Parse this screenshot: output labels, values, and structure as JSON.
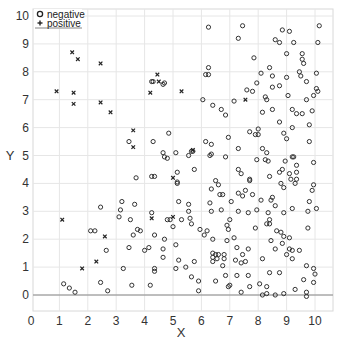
{
  "chart_data": {
    "type": "scatter",
    "title": "",
    "xlabel": "X",
    "ylabel": "Y",
    "xlim": [
      0,
      10.5
    ],
    "ylim": [
      -0.5,
      10.3
    ],
    "xticks": [
      0,
      1,
      2,
      3,
      4,
      5,
      6,
      7,
      8,
      9,
      10
    ],
    "yticks": [
      0,
      1,
      2,
      3,
      4,
      5,
      6,
      7,
      8,
      9,
      10
    ],
    "grid": true,
    "hline_y": 0,
    "legend": {
      "position": "upper left",
      "entries": [
        {
          "label": "negative",
          "marker": "circle"
        },
        {
          "label": "positive",
          "marker": "x"
        }
      ]
    },
    "series": [
      {
        "name": "negative",
        "marker": "circle",
        "points": [
          [
            6.25,
            9.6
          ],
          [
            7.45,
            9.65
          ],
          [
            7.3,
            9.2
          ],
          [
            8.85,
            9.5
          ],
          [
            9.1,
            9.45
          ],
          [
            10.15,
            9.65
          ],
          [
            8.6,
            9.15
          ],
          [
            8.75,
            9.05
          ],
          [
            9.25,
            9.05
          ],
          [
            10.1,
            9.05
          ],
          [
            9.0,
            8.65
          ],
          [
            9.55,
            8.65
          ],
          [
            7.85,
            8.5
          ],
          [
            9.55,
            8.45
          ],
          [
            9.6,
            8.3
          ],
          [
            6.25,
            8.15
          ],
          [
            6.15,
            7.9
          ],
          [
            6.25,
            7.9
          ],
          [
            8.4,
            8.15
          ],
          [
            8.1,
            7.95
          ],
          [
            8.5,
            7.85
          ],
          [
            9.0,
            7.8
          ],
          [
            9.45,
            8.0
          ],
          [
            9.5,
            7.85
          ],
          [
            10.05,
            7.95
          ],
          [
            9.7,
            7.65
          ],
          [
            7.95,
            7.6
          ],
          [
            7.6,
            7.35
          ],
          [
            7.8,
            7.3
          ],
          [
            8.5,
            7.45
          ],
          [
            8.75,
            7.5
          ],
          [
            10.05,
            7.4
          ],
          [
            10.1,
            7.3
          ],
          [
            9.95,
            7.15
          ],
          [
            8.25,
            7.1
          ],
          [
            8.3,
            7.0
          ],
          [
            9.05,
            7.15
          ],
          [
            6.05,
            7.0
          ],
          [
            7.15,
            6.95
          ],
          [
            9.7,
            7.0
          ],
          [
            6.4,
            6.8
          ],
          [
            6.7,
            6.65
          ],
          [
            6.85,
            6.45
          ],
          [
            8.5,
            6.65
          ],
          [
            8.15,
            6.55
          ],
          [
            9.2,
            6.65
          ],
          [
            9.35,
            6.5
          ],
          [
            9.55,
            6.5
          ],
          [
            9.9,
            6.6
          ],
          [
            8.75,
            6.2
          ],
          [
            9.2,
            6.0
          ],
          [
            9.8,
            6.1
          ],
          [
            6.95,
            5.65
          ],
          [
            7.7,
            5.85
          ],
          [
            8.0,
            5.95
          ],
          [
            7.9,
            5.75
          ],
          [
            8.0,
            5.75
          ],
          [
            8.9,
            5.8
          ],
          [
            9.0,
            5.6
          ],
          [
            9.8,
            5.5
          ],
          [
            6.15,
            5.5
          ],
          [
            6.35,
            5.4
          ],
          [
            7.3,
            5.25
          ],
          [
            8.15,
            5.25
          ],
          [
            8.3,
            5.1
          ],
          [
            6.35,
            5.05
          ],
          [
            6.85,
            4.95
          ],
          [
            9.2,
            4.95
          ],
          [
            4.25,
            7.65
          ],
          [
            4.7,
            7.6
          ],
          [
            4.3,
            7.65
          ],
          [
            4.65,
            7.55
          ],
          [
            4.85,
            5.8
          ],
          [
            3.45,
            5.5
          ],
          [
            4.3,
            5.5
          ],
          [
            4.65,
            5.1
          ],
          [
            4.7,
            4.95
          ],
          [
            4.8,
            4.9
          ],
          [
            5.1,
            5.1
          ],
          [
            5.55,
            5.0
          ],
          [
            5.65,
            5.15
          ],
          [
            5.7,
            5.15
          ],
          [
            5.15,
            4.4
          ],
          [
            5.75,
            4.5
          ],
          [
            3.7,
            4.2
          ],
          [
            4.25,
            4.25
          ],
          [
            4.35,
            4.25
          ],
          [
            5.15,
            4.0
          ],
          [
            6.3,
            5.0
          ],
          [
            7.95,
            4.85
          ],
          [
            8.25,
            4.85
          ],
          [
            8.35,
            4.8
          ],
          [
            9.25,
            4.95
          ],
          [
            8.95,
            4.8
          ],
          [
            9.35,
            4.65
          ],
          [
            9.95,
            4.75
          ],
          [
            7.3,
            4.5
          ],
          [
            7.4,
            4.35
          ],
          [
            8.75,
            4.4
          ],
          [
            8.85,
            4.5
          ],
          [
            9.1,
            4.35
          ],
          [
            9.35,
            4.4
          ],
          [
            9.15,
            4.15
          ],
          [
            9.35,
            4.15
          ],
          [
            9.3,
            4.0
          ],
          [
            8.4,
            4.25
          ],
          [
            7.7,
            4.15
          ],
          [
            7.7,
            4.1
          ],
          [
            6.5,
            4.1
          ],
          [
            6.6,
            3.95
          ],
          [
            6.35,
            3.8
          ],
          [
            5.15,
            4.05
          ],
          [
            8.8,
            4.0
          ],
          [
            8.9,
            3.85
          ],
          [
            9.95,
            3.95
          ],
          [
            9.9,
            3.75
          ],
          [
            6.65,
            3.6
          ],
          [
            6.75,
            3.6
          ],
          [
            7.3,
            3.65
          ],
          [
            7.45,
            3.55
          ],
          [
            7.55,
            3.75
          ],
          [
            7.8,
            3.6
          ],
          [
            8.5,
            3.5
          ],
          [
            8.45,
            3.4
          ],
          [
            5.2,
            3.35
          ],
          [
            5.55,
            3.25
          ],
          [
            6.3,
            3.3
          ],
          [
            7.05,
            3.35
          ],
          [
            8.1,
            3.4
          ],
          [
            8.6,
            3.2
          ],
          [
            9.8,
            3.35
          ],
          [
            5.55,
            3.0
          ],
          [
            6.35,
            3.0
          ],
          [
            6.7,
            3.05
          ],
          [
            7.3,
            3.0
          ],
          [
            7.65,
            2.95
          ],
          [
            7.95,
            3.05
          ],
          [
            8.35,
            2.95
          ],
          [
            8.9,
            2.95
          ],
          [
            9.2,
            3.1
          ],
          [
            9.75,
            3.0
          ],
          [
            10.05,
            3.1
          ],
          [
            5.3,
            2.7
          ],
          [
            5.6,
            2.75
          ],
          [
            5.65,
            2.55
          ],
          [
            7.0,
            2.7
          ],
          [
            6.9,
            2.5
          ],
          [
            6.95,
            2.35
          ],
          [
            8.4,
            2.7
          ],
          [
            8.4,
            2.55
          ],
          [
            8.3,
            2.55
          ],
          [
            7.9,
            2.4
          ],
          [
            5.95,
            2.35
          ],
          [
            6.2,
            2.3
          ],
          [
            6.1,
            2.15
          ],
          [
            9.75,
            2.4
          ],
          [
            8.65,
            2.3
          ],
          [
            8.8,
            2.25
          ],
          [
            8.9,
            2.1
          ],
          [
            9.1,
            2.05
          ],
          [
            7.15,
            2.05
          ],
          [
            6.4,
            2.0
          ],
          [
            6.9,
            1.95
          ],
          [
            8.45,
            1.95
          ],
          [
            8.85,
            1.85
          ],
          [
            5.1,
            1.8
          ],
          [
            7.25,
            1.7
          ],
          [
            7.65,
            1.65
          ],
          [
            8.6,
            1.65
          ],
          [
            9.1,
            1.65
          ],
          [
            9.2,
            1.6
          ],
          [
            9.45,
            1.6
          ],
          [
            9.0,
            1.45
          ],
          [
            6.4,
            1.5
          ],
          [
            6.5,
            1.45
          ],
          [
            6.4,
            1.35
          ],
          [
            6.6,
            1.45
          ],
          [
            6.8,
            1.45
          ],
          [
            6.8,
            1.3
          ],
          [
            6.55,
            1.3
          ],
          [
            6.4,
            1.2
          ],
          [
            7.45,
            1.45
          ],
          [
            7.2,
            1.25
          ],
          [
            7.4,
            1.15
          ],
          [
            7.55,
            1.2
          ],
          [
            9.2,
            1.3
          ],
          [
            8.15,
            1.3
          ],
          [
            5.2,
            1.25
          ],
          [
            5.75,
            1.2
          ],
          [
            3.2,
            3.35
          ],
          [
            3.65,
            3.25
          ],
          [
            2.45,
            3.15
          ],
          [
            3.15,
            3.05
          ],
          [
            4.25,
            2.95
          ],
          [
            3.1,
            2.8
          ],
          [
            3.5,
            2.7
          ],
          [
            4.8,
            2.7
          ],
          [
            4.9,
            2.7
          ],
          [
            5.0,
            2.45
          ],
          [
            2.1,
            2.3
          ],
          [
            2.25,
            2.3
          ],
          [
            3.75,
            2.35
          ],
          [
            3.85,
            2.3
          ],
          [
            3.6,
            2.15
          ],
          [
            4.35,
            2.15
          ],
          [
            4.7,
            2.0
          ],
          [
            3.45,
            1.7
          ],
          [
            2.65,
            1.6
          ],
          [
            4.0,
            1.6
          ],
          [
            4.15,
            1.7
          ],
          [
            4.65,
            1.65
          ],
          [
            4.65,
            1.35
          ],
          [
            3.25,
            0.95
          ],
          [
            4.35,
            0.95
          ],
          [
            4.35,
            0.85
          ],
          [
            5.1,
            0.95
          ],
          [
            5.45,
            1.0
          ],
          [
            1.15,
            0.4
          ],
          [
            1.35,
            0.25
          ],
          [
            1.55,
            0.1
          ],
          [
            2.45,
            0.45
          ],
          [
            2.7,
            0.15
          ],
          [
            3.55,
            0.35
          ],
          [
            4.2,
            0.35
          ],
          [
            5.65,
            0.65
          ],
          [
            5.9,
            0.5
          ],
          [
            5.9,
            0.15
          ],
          [
            6.5,
            0.5
          ],
          [
            6.75,
            1.05
          ],
          [
            6.85,
            0.7
          ],
          [
            7.0,
            0.35
          ],
          [
            6.95,
            0.3
          ],
          [
            7.25,
            0.7
          ],
          [
            7.4,
            0.1
          ],
          [
            7.65,
            0.7
          ],
          [
            7.7,
            0.3
          ],
          [
            8.05,
            0.4
          ],
          [
            8.15,
            0.0
          ],
          [
            8.3,
            0.3
          ],
          [
            8.3,
            0.05
          ],
          [
            8.4,
            0.8
          ],
          [
            8.75,
            0.8
          ],
          [
            8.6,
            0.0
          ],
          [
            8.9,
            0.05
          ],
          [
            9.3,
            0.2
          ],
          [
            9.6,
            0.55
          ],
          [
            9.7,
            0.1
          ],
          [
            9.7,
            1.05
          ],
          [
            9.7,
            -0.05
          ],
          [
            9.95,
            0.95
          ],
          [
            10.0,
            0.75
          ],
          [
            9.95,
            0.45
          ]
        ]
      },
      {
        "name": "positive",
        "marker": "x",
        "points": [
          [
            0.9,
            7.3
          ],
          [
            1.45,
            8.7
          ],
          [
            1.65,
            8.45
          ],
          [
            2.45,
            8.3
          ],
          [
            1.5,
            7.25
          ],
          [
            1.5,
            6.85
          ],
          [
            2.45,
            6.9
          ],
          [
            2.8,
            6.55
          ],
          [
            4.45,
            7.9
          ],
          [
            4.5,
            7.65
          ],
          [
            4.2,
            7.25
          ],
          [
            5.3,
            7.3
          ],
          [
            3.6,
            5.9
          ],
          [
            3.6,
            5.3
          ],
          [
            5.7,
            5.2
          ],
          [
            5.0,
            4.2
          ],
          [
            1.1,
            2.7
          ],
          [
            2.6,
            2.1
          ],
          [
            2.3,
            1.2
          ],
          [
            1.8,
            0.95
          ],
          [
            4.25,
            2.75
          ],
          [
            5.0,
            2.8
          ],
          [
            7.55,
            7.0
          ]
        ]
      }
    ]
  }
}
